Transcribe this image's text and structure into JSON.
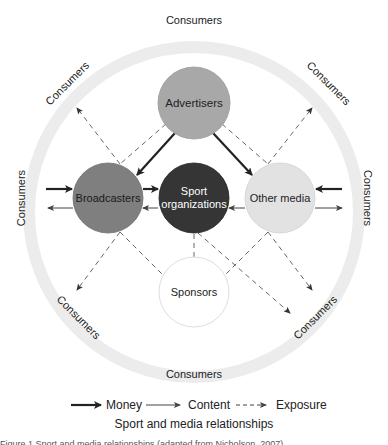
{
  "diagram": {
    "ring_label": "Consumers",
    "ring_labels": {
      "top": "Consumers",
      "bottom": "Consumers",
      "left": "Consumers",
      "right": "Consumers",
      "top_left": "Consumers",
      "top_right": "Consumers",
      "bottom_left": "Consumers",
      "bottom_right": "Consumers"
    },
    "nodes": {
      "advertisers": {
        "label": "Advertisers",
        "fill": "#a8a8a8"
      },
      "broadcasters": {
        "label": "Broadcasters",
        "fill": "#7f7f7f"
      },
      "sport": {
        "label_line1": "Sport",
        "label_line2": "organizations",
        "fill": "#353535"
      },
      "other_media": {
        "label": "Other media",
        "fill": "#e2e2e2"
      },
      "sponsors": {
        "label": "Sponsors",
        "fill": "#ffffff"
      }
    },
    "ring_color": "#ececec"
  },
  "legend": {
    "money": "Money",
    "content": "Content",
    "exposure": "Exposure"
  },
  "title": "Sport and media relationships",
  "caption": "Figure 1 Sport and media relationships (adapted from Nicholson, 2007)"
}
